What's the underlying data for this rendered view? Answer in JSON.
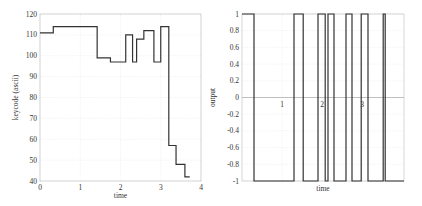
{
  "chart_data": [
    {
      "type": "line",
      "step": true,
      "title": "",
      "xlabel": "time",
      "ylabel": "keycode (ascii)",
      "xlim": [
        0,
        4
      ],
      "ylim": [
        40,
        120
      ],
      "xticks": [
        "0",
        "1",
        "2",
        "3",
        "4"
      ],
      "yticks": [
        "40",
        "50",
        "60",
        "70",
        "80",
        "90",
        "100",
        "110",
        "120"
      ],
      "grid": true,
      "x": [
        0,
        0.33,
        1.42,
        1.75,
        2.13,
        2.3,
        2.4,
        2.58,
        2.83,
        3.0,
        3.2,
        3.38,
        3.6,
        3.72
      ],
      "values": [
        111,
        114,
        99,
        97,
        110,
        97,
        108,
        112,
        97,
        114,
        57,
        48,
        42,
        42
      ]
    },
    {
      "type": "line",
      "step": true,
      "title": "",
      "xlabel": "time",
      "ylabel": "output",
      "xlim": [
        0,
        4.05
      ],
      "ylim": [
        -1,
        1
      ],
      "xticks": [
        "1",
        "2",
        "3"
      ],
      "yticks": [
        "-1",
        "-0.8",
        "-0.6",
        "-0.4",
        "-0.2",
        "0",
        "0.2",
        "0.4",
        "0.6",
        "0.8",
        "1"
      ],
      "grid": true,
      "x": [
        0,
        0.3,
        1.3,
        1.53,
        1.9,
        2.08,
        2.15,
        2.3,
        2.6,
        2.75,
        2.98,
        3.15,
        3.53,
        3.58,
        4.05
      ],
      "values": [
        1,
        -1,
        1,
        -1,
        1,
        -1,
        1,
        -1,
        1,
        -1,
        1,
        -1,
        1,
        -1,
        -1
      ]
    }
  ]
}
